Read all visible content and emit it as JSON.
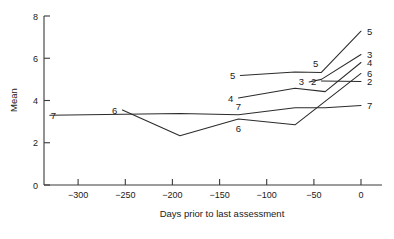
{
  "chart_data": {
    "type": "line",
    "title": "",
    "xlabel": "Days prior to last assessment",
    "ylabel": "Mean",
    "xlim": [
      -330,
      18
    ],
    "ylim": [
      0,
      8
    ],
    "grid": false,
    "legend": "inline-endpoint-labels",
    "xticks": [
      -300,
      -250,
      -200,
      -150,
      -100,
      -50,
      0
    ],
    "xtick_labels": [
      "−300",
      "−250",
      "−200",
      "−150",
      "−100",
      "−50",
      "0"
    ],
    "yticks": [
      0,
      2,
      4,
      6,
      8
    ],
    "ytick_labels": [
      "0",
      "2",
      "4",
      "6",
      "8"
    ],
    "series": [
      {
        "name": "2",
        "label_left": "2",
        "label_right": "2",
        "x": [
          -42,
          0
        ],
        "values": [
          4.92,
          4.9
        ]
      },
      {
        "name": "3",
        "label_left": "3",
        "label_right": "3",
        "x": [
          -55,
          -42,
          0
        ],
        "values": [
          4.88,
          5.0,
          6.18
        ]
      },
      {
        "name": "4",
        "label_left": "4",
        "label_right": "4",
        "x": [
          -130,
          -70,
          -38,
          0
        ],
        "values": [
          4.12,
          4.58,
          4.42,
          5.8
        ]
      },
      {
        "name": "5",
        "label_left": "5",
        "label_right": "5",
        "x": [
          -128,
          -70,
          -42,
          0
        ],
        "values": [
          5.18,
          5.35,
          5.33,
          7.28
        ]
      },
      {
        "name": "6",
        "label_left": "6",
        "label_right": "6",
        "x": [
          -253,
          -192,
          -130,
          -70,
          0
        ],
        "values": [
          3.55,
          2.33,
          3.12,
          2.85,
          5.28
        ]
      },
      {
        "name": "7",
        "label_left": "7",
        "label_right": "7",
        "x": [
          -330,
          -192,
          -130,
          -70,
          -38,
          0
        ],
        "values": [
          3.3,
          3.38,
          3.33,
          3.66,
          3.66,
          3.76
        ]
      }
    ],
    "endpoint_labels_right": [
      {
        "series": "5",
        "text": "5",
        "value": 7.28
      },
      {
        "series": "3",
        "text": "3",
        "value": 6.18
      },
      {
        "series": "4",
        "text": "4",
        "value": 5.8
      },
      {
        "series": "6",
        "text": "6",
        "value": 5.28
      },
      {
        "series": "2",
        "text": "2",
        "value": 4.9
      },
      {
        "series": "7",
        "text": "7",
        "value": 3.76
      }
    ],
    "inline_labels": [
      {
        "text": "5",
        "x": -128,
        "value": 5.18
      },
      {
        "text": "4",
        "x": -130,
        "value": 4.12
      },
      {
        "text": "3",
        "x": -55,
        "value": 4.88
      },
      {
        "text": "2",
        "x": -42,
        "value": 4.92
      },
      {
        "text": "5",
        "x": -48,
        "value": 5.33
      },
      {
        "text": "7",
        "x": -130,
        "value": 3.33
      },
      {
        "text": "6",
        "x": -130,
        "value": 3.12
      },
      {
        "text": "6",
        "x": -253,
        "value": 3.55
      },
      {
        "text": "7",
        "x": -330,
        "value": 3.3
      }
    ]
  },
  "axes": {
    "y_axis_title": "Mean",
    "x_axis_title": "Days prior to last assessment"
  }
}
